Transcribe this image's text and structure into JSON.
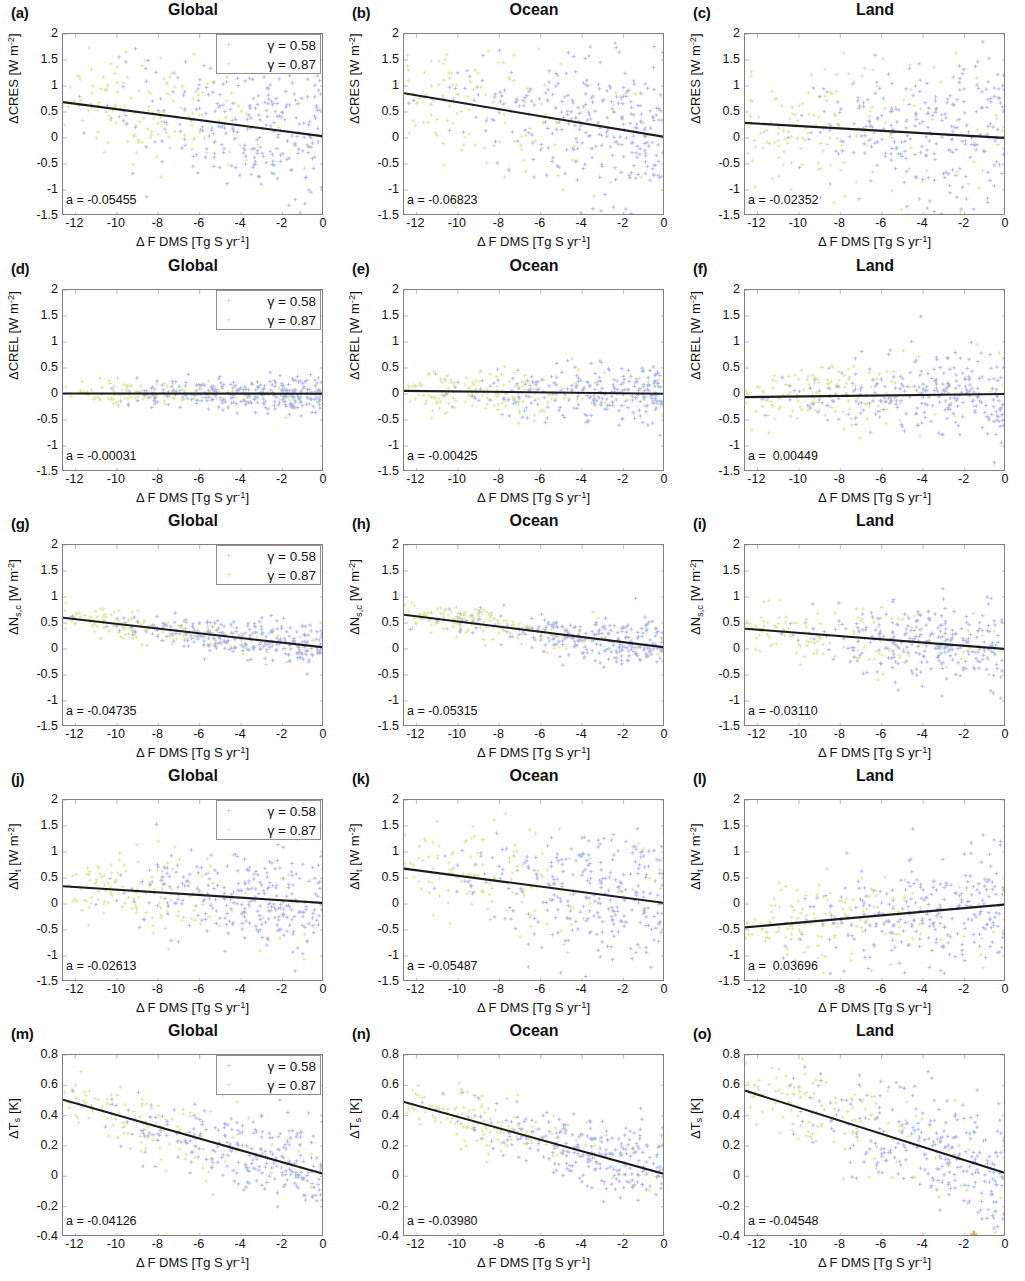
{
  "figure": {
    "columns": [
      "Global",
      "Ocean",
      "Land"
    ],
    "x_axis": {
      "label_plain": "Δ F DMS [Tg S yr⁻¹]",
      "ticks": [
        "-12",
        "-10",
        "-8",
        "-6",
        "-4",
        "-2",
        "0"
      ],
      "tick_values": [
        -12,
        -10,
        -8,
        -6,
        -4,
        -2,
        0
      ],
      "min": -12.6,
      "max": 0
    },
    "legend": {
      "entries": [
        {
          "label": "γ = 0.58",
          "marker": "dot",
          "color": "#b9c4e8"
        },
        {
          "label": "γ = 0.87",
          "marker": "dot",
          "color": "#d8e49a"
        }
      ]
    },
    "colors": {
      "series_gamma_058": "#aab6e2",
      "series_gamma_087": "#d7e59b",
      "fit_line": "#1c1c1c",
      "axis": "#808080",
      "text": "#111111",
      "stray_marker": "#e8a33d"
    }
  },
  "chart_data": [
    {
      "type": "scatter",
      "panel": "a",
      "title": "Global",
      "ylabel": "ΔCRES [W m⁻²]",
      "xlabel": "Δ F DMS [Tg S yr⁻¹]",
      "ylim": [
        -1.5,
        2
      ],
      "xlim": [
        -12.6,
        0
      ],
      "yticks": [
        "2",
        "1.5",
        "1",
        "0.5",
        "0",
        "-0.5",
        "-1",
        "-1.5"
      ],
      "ytick_values": [
        2,
        1.5,
        1,
        0.5,
        0,
        -0.5,
        -1,
        -1.5
      ],
      "slope_label": "a = -0.05455",
      "slope": -0.05455,
      "fit_y_at_xmin": 0.69,
      "fit_y_at_xmax": 0.03,
      "spread": 0.52,
      "center_offset": 0.12,
      "n_points": 420,
      "seed": 11
    },
    {
      "type": "scatter",
      "panel": "b",
      "title": "Ocean",
      "ylabel": "ΔCRES [W m⁻²]",
      "xlabel": "Δ F DMS [Tg S yr⁻¹]",
      "ylim": [
        -1.5,
        2
      ],
      "xlim": [
        -12.6,
        0
      ],
      "yticks": [
        "2",
        "1.5",
        "1",
        "0.5",
        "0",
        "-0.5",
        "-1",
        "-1.5"
      ],
      "ytick_values": [
        2,
        1.5,
        1,
        0.5,
        0,
        -0.5,
        -1,
        -1.5
      ],
      "slope_label": "a = -0.06823",
      "slope": -0.06823,
      "fit_y_at_xmin": 0.86,
      "fit_y_at_xmax": 0.02,
      "spread": 0.62,
      "center_offset": 0.08,
      "n_points": 420,
      "seed": 22
    },
    {
      "type": "scatter",
      "panel": "c",
      "title": "Land",
      "ylabel": "ΔCRES [W m⁻²]",
      "xlabel": "Δ F DMS [Tg S yr⁻¹]",
      "ylim": [
        -1.5,
        2
      ],
      "xlim": [
        -12.6,
        0
      ],
      "yticks": [
        "2",
        "1.5",
        "1",
        "0.5",
        "0",
        "-0.5",
        "-1",
        "-1.5"
      ],
      "ytick_values": [
        2,
        1.5,
        1,
        0.5,
        0,
        -0.5,
        -1,
        -1.5
      ],
      "slope_label": "a = -0.02352",
      "slope": -0.02352,
      "fit_y_at_xmin": 0.29,
      "fit_y_at_xmax": 0.0,
      "spread": 0.68,
      "center_offset": 0.05,
      "n_points": 420,
      "seed": 33
    },
    {
      "type": "scatter",
      "panel": "d",
      "title": "Global",
      "ylabel": "ΔCREL [W m⁻²]",
      "xlabel": "Δ F DMS [Tg S yr⁻¹]",
      "ylim": [
        -1.5,
        2
      ],
      "xlim": [
        -12.6,
        0
      ],
      "yticks": [
        "2",
        "1.5",
        "1",
        "0.5",
        "0",
        "-0.5",
        "-1",
        "-1.5"
      ],
      "ytick_values": [
        2,
        1.5,
        1,
        0.5,
        0,
        -0.5,
        -1,
        -1.5
      ],
      "slope_label": "a = -0.00031",
      "slope": -0.00031,
      "fit_y_at_xmin": 0.01,
      "fit_y_at_xmax": 0.005,
      "spread": 0.14,
      "center_offset": 0.0,
      "n_points": 420,
      "seed": 44
    },
    {
      "type": "scatter",
      "panel": "e",
      "title": "Ocean",
      "ylabel": "ΔCREL [W m⁻²]",
      "xlabel": "Δ F DMS [Tg S yr⁻¹]",
      "ylim": [
        -1.5,
        2
      ],
      "xlim": [
        -12.6,
        0
      ],
      "yticks": [
        "2",
        "1.5",
        "1",
        "0.5",
        "0",
        "-0.5",
        "-1",
        "-1.5"
      ],
      "ytick_values": [
        2,
        1.5,
        1,
        0.5,
        0,
        -0.5,
        -1,
        -1.5
      ],
      "slope_label": "a = -0.00425",
      "slope": -0.00425,
      "fit_y_at_xmin": 0.06,
      "fit_y_at_xmax": 0.005,
      "spread": 0.24,
      "center_offset": 0.0,
      "n_points": 420,
      "seed": 55
    },
    {
      "type": "scatter",
      "panel": "f",
      "title": "Land",
      "ylabel": "ΔCREL [W m⁻²]",
      "xlabel": "Δ F DMS [Tg S yr⁻¹]",
      "ylim": [
        -1.5,
        2
      ],
      "xlim": [
        -12.6,
        0
      ],
      "yticks": [
        "2",
        "1.5",
        "1",
        "0.5",
        "0",
        "-0.5",
        "-1",
        "-1.5"
      ],
      "ytick_values": [
        2,
        1.5,
        1,
        0.5,
        0,
        -0.5,
        -1,
        -1.5
      ],
      "slope_label": "a =  0.00449",
      "slope": 0.00449,
      "fit_y_at_xmin": -0.06,
      "fit_y_at_xmax": 0.0,
      "spread": 0.36,
      "center_offset": -0.02,
      "n_points": 420,
      "seed": 66
    },
    {
      "type": "scatter",
      "panel": "g",
      "title": "Global",
      "ylabel": "ΔN_s,c [W m⁻²]",
      "xlabel": "Δ F DMS [Tg S yr⁻¹]",
      "ylim": [
        -1.5,
        2
      ],
      "xlim": [
        -12.6,
        0
      ],
      "yticks": [
        "2",
        "1.5",
        "1",
        "0.5",
        "0",
        "-0.5",
        "-1",
        "-1.5"
      ],
      "ytick_values": [
        2,
        1.5,
        1,
        0.5,
        0,
        -0.5,
        -1,
        -1.5
      ],
      "slope_label": "a = -0.04735",
      "slope": -0.04735,
      "fit_y_at_xmin": 0.6,
      "fit_y_at_xmax": 0.03,
      "spread": 0.16,
      "center_offset": 0.0,
      "n_points": 420,
      "seed": 77
    },
    {
      "type": "scatter",
      "panel": "h",
      "title": "Ocean",
      "ylabel": "ΔN_s,c [W m⁻²]",
      "xlabel": "Δ F DMS [Tg S yr⁻¹]",
      "ylim": [
        -1.5,
        2
      ],
      "xlim": [
        -12.6,
        0
      ],
      "yticks": [
        "2",
        "1.5",
        "1",
        "0.5",
        "0",
        "-0.5",
        "-1",
        "-1.5"
      ],
      "ytick_values": [
        2,
        1.5,
        1,
        0.5,
        0,
        -0.5,
        -1,
        -1.5
      ],
      "slope_label": "a = -0.05315",
      "slope": -0.05315,
      "fit_y_at_xmin": 0.66,
      "fit_y_at_xmax": 0.03,
      "spread": 0.18,
      "center_offset": 0.0,
      "n_points": 420,
      "seed": 88
    },
    {
      "type": "scatter",
      "panel": "i",
      "title": "Land",
      "ylabel": "ΔN_s,c [W m⁻²]",
      "xlabel": "Δ F DMS [Tg S yr⁻¹]",
      "ylim": [
        -1.5,
        2
      ],
      "xlim": [
        -12.6,
        0
      ],
      "yticks": [
        "2",
        "1.5",
        "1",
        "0.5",
        "0",
        "-0.5",
        "-1",
        "-1.5"
      ],
      "ytick_values": [
        2,
        1.5,
        1,
        0.5,
        0,
        -0.5,
        -1,
        -1.5
      ],
      "slope_label": "a = -0.03110",
      "slope": -0.0311,
      "fit_y_at_xmin": 0.39,
      "fit_y_at_xmax": 0.0,
      "spread": 0.35,
      "center_offset": 0.0,
      "n_points": 420,
      "seed": 99
    },
    {
      "type": "scatter",
      "panel": "j",
      "title": "Global",
      "ylabel": "ΔN_t [W m⁻²]",
      "xlabel": "Δ F DMS [Tg S yr⁻¹]",
      "ylim": [
        -1.5,
        2
      ],
      "xlim": [
        -12.6,
        0
      ],
      "yticks": [
        "2",
        "1.5",
        "1",
        "0.5",
        "0",
        "-0.5",
        "-1",
        "-1.5"
      ],
      "ytick_values": [
        2,
        1.5,
        1,
        0.5,
        0,
        -0.5,
        -1,
        -1.5
      ],
      "slope_label": "a = -0.02613",
      "slope": -0.02613,
      "fit_y_at_xmin": 0.34,
      "fit_y_at_xmax": 0.02,
      "spread": 0.42,
      "center_offset": 0.0,
      "n_points": 420,
      "seed": 101
    },
    {
      "type": "scatter",
      "panel": "k",
      "title": "Ocean",
      "ylabel": "ΔN_t [W m⁻²]",
      "xlabel": "Δ F DMS [Tg S yr⁻¹]",
      "ylim": [
        -1.5,
        2
      ],
      "xlim": [
        -12.6,
        0
      ],
      "yticks": [
        "2",
        "1.5",
        "1",
        "0.5",
        "0",
        "-0.5",
        "-1",
        "-1.5"
      ],
      "ytick_values": [
        2,
        1.5,
        1,
        0.5,
        0,
        -0.5,
        -1,
        -1.5
      ],
      "slope_label": "a = -0.05487",
      "slope": -0.05487,
      "fit_y_at_xmin": 0.68,
      "fit_y_at_xmax": 0.02,
      "spread": 0.52,
      "center_offset": 0.0,
      "n_points": 420,
      "seed": 112
    },
    {
      "type": "scatter",
      "panel": "l",
      "title": "Land",
      "ylabel": "ΔN_t [W m⁻²]",
      "xlabel": "Δ F DMS [Tg S yr⁻¹]",
      "ylim": [
        -1.5,
        2
      ],
      "xlim": [
        -12.6,
        0
      ],
      "yticks": [
        "2",
        "1.5",
        "1",
        "0.5",
        "0",
        "-0.5",
        "-1",
        "-1.5"
      ],
      "ytick_values": [
        2,
        1.5,
        1,
        0.5,
        0,
        -0.5,
        -1,
        -1.5
      ],
      "slope_label": "a =  0.03696",
      "slope": 0.03696,
      "fit_y_at_xmin": -0.45,
      "fit_y_at_xmax": -0.01,
      "spread": 0.45,
      "center_offset": 0.0,
      "n_points": 420,
      "seed": 123
    },
    {
      "type": "scatter",
      "panel": "m",
      "title": "Global",
      "ylabel": "ΔT_s [K]",
      "xlabel": "Δ F DMS [Tg S yr⁻¹]",
      "ylim": [
        -0.4,
        0.8
      ],
      "xlim": [
        -12.6,
        0
      ],
      "yticks": [
        "0.8",
        "0.6",
        "0.4",
        "0.2",
        "0",
        "-0.2",
        "-0.4"
      ],
      "ytick_values": [
        0.8,
        0.6,
        0.4,
        0.2,
        0,
        -0.2,
        -0.4
      ],
      "slope_label": "a = -0.04126",
      "slope": -0.04126,
      "fit_y_at_xmin": 0.505,
      "fit_y_at_xmax": 0.015,
      "spread": 0.115,
      "center_offset": 0.0,
      "n_points": 400,
      "seed": 134
    },
    {
      "type": "scatter",
      "panel": "n",
      "title": "Ocean",
      "ylabel": "ΔT_s [K]",
      "xlabel": "Δ F DMS [Tg S yr⁻¹]",
      "ylim": [
        -0.4,
        0.8
      ],
      "xlim": [
        -12.6,
        0
      ],
      "yticks": [
        "0.8",
        "0.6",
        "0.4",
        "0.2",
        "0",
        "-0.2",
        "-0.4"
      ],
      "ytick_values": [
        0.8,
        0.6,
        0.4,
        0.2,
        0,
        -0.2,
        -0.4
      ],
      "slope_label": "a = -0.03980",
      "slope": -0.0398,
      "fit_y_at_xmin": 0.49,
      "fit_y_at_xmax": 0.015,
      "spread": 0.1,
      "center_offset": 0.0,
      "n_points": 400,
      "seed": 145
    },
    {
      "type": "scatter",
      "panel": "o",
      "title": "Land",
      "ylabel": "ΔT_s [K]",
      "xlabel": "Δ F DMS [Tg S yr⁻¹]",
      "ylim": [
        -0.4,
        0.8
      ],
      "xlim": [
        -12.6,
        0
      ],
      "yticks": [
        "0.8",
        "0.6",
        "0.4",
        "0.2",
        "0",
        "-0.2",
        "-0.4"
      ],
      "ytick_values": [
        0.8,
        0.6,
        0.4,
        0.2,
        0,
        -0.2,
        -0.4
      ],
      "slope_label": "a = -0.04548",
      "slope": -0.04548,
      "fit_y_at_xmin": 0.565,
      "fit_y_at_xmax": 0.02,
      "spread": 0.17,
      "center_offset": 0.0,
      "n_points": 400,
      "seed": 156,
      "has_stray_marker": true
    }
  ],
  "panels": {
    "a": {
      "letter": "(a)"
    },
    "b": {
      "letter": "(b)"
    },
    "c": {
      "letter": "(c)"
    },
    "d": {
      "letter": "(d)"
    },
    "e": {
      "letter": "(e)"
    },
    "f": {
      "letter": "(f)"
    },
    "g": {
      "letter": "(g)"
    },
    "h": {
      "letter": "(h)"
    },
    "i": {
      "letter": "(i)"
    },
    "j": {
      "letter": "(j)"
    },
    "k": {
      "letter": "(k)"
    },
    "l": {
      "letter": "(l)"
    },
    "m": {
      "letter": "(m)"
    },
    "n": {
      "letter": "(n)"
    },
    "o": {
      "letter": "(o)"
    }
  }
}
